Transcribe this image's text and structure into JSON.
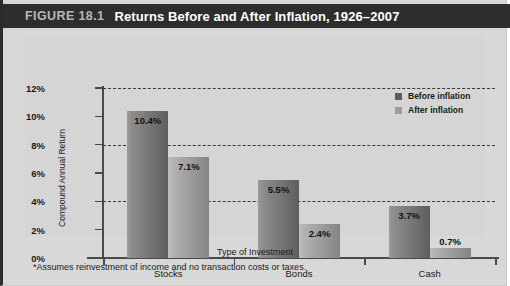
{
  "figure": {
    "number": "FIGURE 18.1",
    "title": "Returns Before and After Inflation, 1926–2007"
  },
  "legend": {
    "items": [
      {
        "label": "Before inflation",
        "color": "#5d5d5d"
      },
      {
        "label": "After inflation",
        "color": "#9d9d9d"
      }
    ]
  },
  "axes": {
    "y_title": "Compound Annual Return",
    "x_title": "Type of Investment",
    "y_ticks": [
      "0%",
      "2%",
      "4%",
      "6%",
      "8%",
      "10%",
      "12%"
    ]
  },
  "footnote": "*Assumes reinvestment of income and no transaction costs or taxes.",
  "chart_data": {
    "type": "bar",
    "title": "Returns Before and After Inflation, 1926–2007",
    "xlabel": "Type of Investment",
    "ylabel": "Compound Annual Return",
    "categories": [
      "Stocks",
      "Bonds",
      "Cash"
    ],
    "series": [
      {
        "name": "Before inflation",
        "color": "#6e6e6e",
        "values": [
          10.4,
          5.5,
          3.7
        ],
        "labels": [
          "10.4%",
          "5.5%",
          "3.7%"
        ]
      },
      {
        "name": "After inflation",
        "color": "#9d9d9d",
        "values": [
          7.1,
          2.4,
          0.7
        ],
        "labels": [
          "7.1%",
          "2.4%",
          "0.7%"
        ]
      }
    ],
    "ylim": [
      0,
      12
    ],
    "ytick_step": 2,
    "ytick_suffix": "%",
    "gridlines_at": [
      4,
      8,
      12
    ],
    "grid": true,
    "legend_position": "top-right"
  }
}
